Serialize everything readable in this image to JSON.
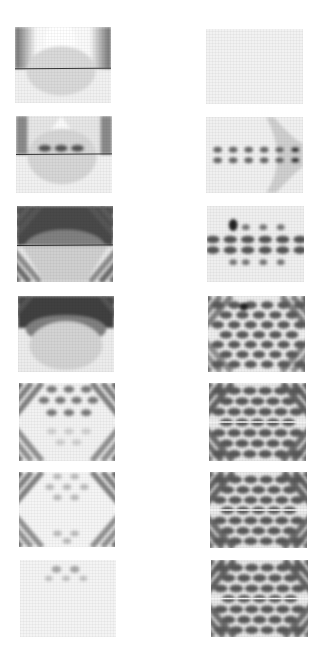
{
  "figure": {
    "background": "#ffffff",
    "layout": {
      "rows": 7,
      "columns": 2
    },
    "panels": [
      {
        "id": "L1",
        "col": 0,
        "row": 0,
        "x": 15,
        "y": 27,
        "w": 96,
        "h": 76,
        "fill": "#f1f1f1",
        "band": {
          "kind": "cap",
          "y_top": 0,
          "y_split": 0.55,
          "dark": "#6d6d6d",
          "light": "#fafafa"
        },
        "lower": {
          "kind": "dome",
          "shade": "#d9d9d9"
        },
        "blobs": [],
        "stripes": 0,
        "midline": "#222222"
      },
      {
        "id": "R1",
        "col": 1,
        "row": 0,
        "x": 206,
        "y": 29,
        "w": 97,
        "h": 75,
        "fill": "#f2f2f2",
        "band": null,
        "lower": null,
        "blobs": [],
        "stripes": 0,
        "midline": null
      },
      {
        "id": "L2",
        "col": 0,
        "row": 1,
        "x": 16,
        "y": 116,
        "w": 96,
        "h": 77,
        "fill": "#f1f1f1",
        "band": {
          "kind": "arch",
          "y_top": 0,
          "y_split": 0.5,
          "dark": "#5e5e5e",
          "light": "#fbfbfb"
        },
        "lower": {
          "kind": "dome",
          "shade": "#d6d6d6"
        },
        "blobs": [
          [
            0.3,
            0.42,
            0.07,
            0.05,
            "#555"
          ],
          [
            0.47,
            0.42,
            0.07,
            0.05,
            "#555"
          ],
          [
            0.64,
            0.42,
            0.07,
            0.05,
            "#555"
          ]
        ],
        "stripes": 0,
        "midline": "#222222"
      },
      {
        "id": "R2",
        "col": 1,
        "row": 1,
        "x": 206,
        "y": 117,
        "w": 97,
        "h": 76,
        "fill": "#f0f0f0",
        "band": null,
        "lower": {
          "kind": "wing",
          "shade": "#cfcfcf"
        },
        "blobs": "row2",
        "stripes": 0,
        "midline": null
      },
      {
        "id": "L3",
        "col": 0,
        "row": 2,
        "x": 17,
        "y": 206,
        "w": 96,
        "h": 76,
        "fill": "#e8e8e8",
        "band": {
          "kind": "fan",
          "y_top": 0,
          "y_split": 0.52,
          "dark": "#4a4a4a",
          "light": "#f6f6f6"
        },
        "lower": {
          "kind": "trap",
          "shade": "#cfcfcf"
        },
        "blobs": [],
        "stripes": 5,
        "midline": "#222222"
      },
      {
        "id": "R3",
        "col": 1,
        "row": 2,
        "x": 207,
        "y": 206,
        "w": 97,
        "h": 76,
        "fill": "#efefef",
        "band": null,
        "lower": null,
        "blobs": "lattice3",
        "stripes": 0,
        "midline": null
      },
      {
        "id": "L4",
        "col": 0,
        "row": 3,
        "x": 18,
        "y": 296,
        "w": 96,
        "h": 76,
        "fill": "#ececec",
        "band": {
          "kind": "fan",
          "y_top": 0,
          "y_split": 0.42,
          "dark": "#3f3f3f",
          "light": "#f2f2f2"
        },
        "lower": {
          "kind": "grid",
          "shade": "#d3d3d3"
        },
        "blobs": [],
        "stripes": 2,
        "midline": null
      },
      {
        "id": "R4",
        "col": 1,
        "row": 3,
        "x": 208,
        "y": 296,
        "w": 97,
        "h": 76,
        "fill": "#ededed",
        "band": null,
        "lower": null,
        "blobs": "lattice4",
        "stripes": 4,
        "midline": null
      },
      {
        "id": "L5",
        "col": 0,
        "row": 4,
        "x": 19,
        "y": 383,
        "w": 96,
        "h": 78,
        "fill": "#f2f2f2",
        "band": null,
        "lower": null,
        "blobs": "lattice5L",
        "stripes": 4,
        "midline": null
      },
      {
        "id": "R5",
        "col": 1,
        "row": 4,
        "x": 209,
        "y": 383,
        "w": 97,
        "h": 78,
        "fill": "#e9e9e9",
        "band": null,
        "lower": null,
        "blobs": "lattice5R",
        "stripes": 6,
        "midline": null
      },
      {
        "id": "L6",
        "col": 0,
        "row": 5,
        "x": 19,
        "y": 472,
        "w": 96,
        "h": 75,
        "fill": "#f5f5f5",
        "band": null,
        "lower": null,
        "blobs": "lattice6L",
        "stripes": 4,
        "midline": null
      },
      {
        "id": "R6",
        "col": 1,
        "row": 5,
        "x": 210,
        "y": 472,
        "w": 97,
        "h": 76,
        "fill": "#e8e8e8",
        "band": null,
        "lower": null,
        "blobs": "lattice6R",
        "stripes": 6,
        "midline": null
      },
      {
        "id": "L7",
        "col": 0,
        "row": 6,
        "x": 20,
        "y": 560,
        "w": 96,
        "h": 77,
        "fill": "#f4f4f4",
        "band": null,
        "lower": null,
        "blobs": [
          [
            0.38,
            0.12,
            0.05,
            0.045,
            "#a9a9a9"
          ],
          [
            0.57,
            0.12,
            0.05,
            0.045,
            "#a9a9a9"
          ],
          [
            0.3,
            0.24,
            0.04,
            0.035,
            "#c2c2c2"
          ],
          [
            0.48,
            0.24,
            0.04,
            0.035,
            "#c2c2c2"
          ],
          [
            0.66,
            0.24,
            0.04,
            0.035,
            "#c2c2c2"
          ]
        ],
        "stripes": 0,
        "midline": null
      },
      {
        "id": "R7",
        "col": 1,
        "row": 6,
        "x": 211,
        "y": 560,
        "w": 97,
        "h": 77,
        "fill": "#e7e7e7",
        "band": null,
        "lower": null,
        "blobs": "lattice7R",
        "stripes": 6,
        "midline": null
      }
    ]
  }
}
